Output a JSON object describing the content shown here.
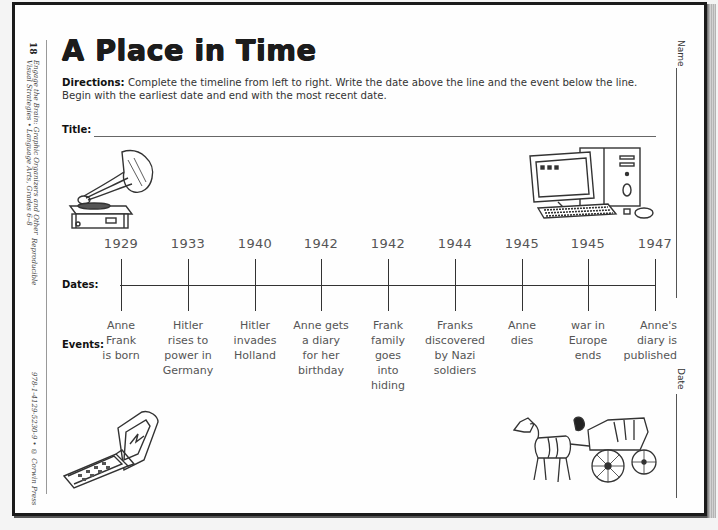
{
  "page": {
    "number": "18",
    "title": "A Place in Time",
    "directions_label": "Directions:",
    "directions_text": "Complete the timeline from left to right. Write the date above the line and the event below the line. Begin with the earliest date and end with the most recent date.",
    "title_field_label": "Title:",
    "dates_label": "Dates:",
    "events_label": "Events:",
    "name_label": "Name",
    "date_label": "Date"
  },
  "margin": {
    "book_line1": "Engage the Brain: Graphic Organizers and Other",
    "book_line2": "Visual Strategies • Language Arts, Grades 6–8",
    "reproducible": "Reproducible",
    "isbn": "978-1-4129-5230-9 • © Corwin Press"
  },
  "illustrations": [
    {
      "name": "phonograph",
      "icon": "phonograph-icon"
    },
    {
      "name": "computer",
      "icon": "desktop-computer-icon"
    },
    {
      "name": "flip-phone",
      "icon": "flip-phone-icon"
    },
    {
      "name": "horse-carriage",
      "icon": "horse-carriage-icon"
    }
  ],
  "timeline": [
    {
      "date": "1929",
      "event": [
        "Anne",
        "Frank",
        "is born"
      ]
    },
    {
      "date": "1933",
      "event": [
        "Hitler",
        "rises to",
        "power in",
        "Germany"
      ]
    },
    {
      "date": "1940",
      "event": [
        "Hitler",
        "invades",
        "Holland"
      ]
    },
    {
      "date": "1942",
      "event": [
        "Anne gets",
        "a diary",
        "for her",
        "birthday"
      ]
    },
    {
      "date": "1942",
      "event": [
        "Frank",
        "family",
        "goes",
        "into",
        "hiding"
      ]
    },
    {
      "date": "1944",
      "event": [
        "Franks",
        "discovered",
        "by Nazi",
        "soldiers"
      ]
    },
    {
      "date": "1945",
      "event": [
        "Anne",
        "dies"
      ]
    },
    {
      "date": "1945",
      "event": [
        "war in",
        "Europe",
        "ends"
      ]
    },
    {
      "date": "1947",
      "event": [
        "Anne's",
        "diary is",
        "published"
      ]
    }
  ]
}
